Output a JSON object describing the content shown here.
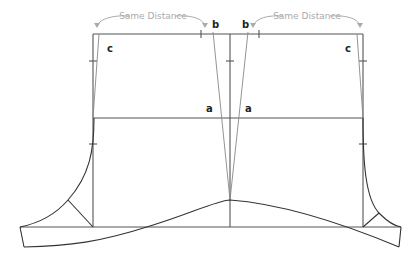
{
  "diagram": {
    "type": "pattern-drafting-diagram",
    "annotations": {
      "left_distance": "Same Distance",
      "right_distance": "Same Distance"
    },
    "labels": {
      "a_left": "a",
      "a_right": "a",
      "b_left": "b",
      "b_right": "b",
      "c_left": "c",
      "c_right": "c"
    },
    "colors": {
      "line": "#555555",
      "annotation": "#aaaaaa",
      "label": "#222222"
    }
  }
}
